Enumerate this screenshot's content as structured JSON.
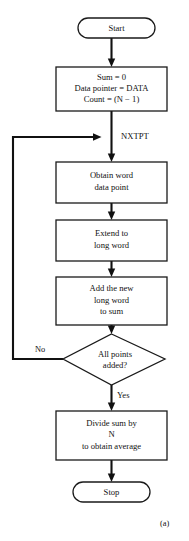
{
  "figure": {
    "caption": "(a)",
    "background_color": "#ffffff",
    "ink_color": "#111111"
  },
  "flowchart": {
    "type": "program-flowchart",
    "title_text": "",
    "nodes": [
      {
        "id": "start",
        "shape": "terminal",
        "lines": [
          "Start"
        ]
      },
      {
        "id": "init",
        "shape": "process",
        "lines": [
          "Sum = 0",
          "Data pointer = DATA",
          "Count = (N − 1)"
        ]
      },
      {
        "id": "obtain",
        "shape": "process",
        "lines": [
          "Obtain word",
          "data point"
        ]
      },
      {
        "id": "extend",
        "shape": "process",
        "lines": [
          "Extend to",
          "long word"
        ]
      },
      {
        "id": "add",
        "shape": "process",
        "lines": [
          "Add the new",
          "long word",
          "to sum"
        ]
      },
      {
        "id": "decision",
        "shape": "decision",
        "lines": [
          "All points",
          "added?"
        ]
      },
      {
        "id": "divide",
        "shape": "process",
        "lines": [
          "Divide sum by",
          "N",
          "to obtain average"
        ]
      },
      {
        "id": "stop",
        "shape": "terminal",
        "lines": [
          "Stop"
        ]
      }
    ],
    "connector_labels": {
      "loop_target": "NXTPT",
      "decision_no": "No",
      "decision_yes": "Yes"
    }
  }
}
